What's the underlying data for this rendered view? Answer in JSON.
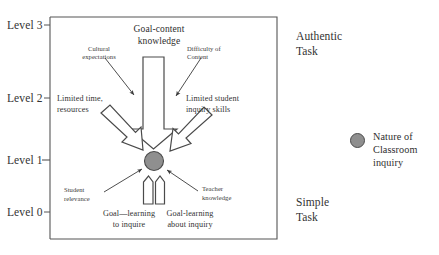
{
  "figure": {
    "type": "conceptual-diagram",
    "background": "#ffffff",
    "outline_color": "#555555"
  },
  "axis": {
    "levels": [
      {
        "label": "Level 3"
      },
      {
        "label": "Level 2"
      },
      {
        "label": "Level 1"
      },
      {
        "label": "Level 0"
      }
    ]
  },
  "side_labels": {
    "top": "Authentic\nTask",
    "top_line1": "Authentic",
    "top_line2": "Task",
    "bottom": "Simple\nTask",
    "bottom_line1": "Simple",
    "bottom_line2": "Task"
  },
  "nodes": {
    "goal_content_knowledge": "Goal-content\nknowledge",
    "goal_content_knowledge_line1": "Goal-content",
    "goal_content_knowledge_line2": "knowledge",
    "cultural_expectations": "Cultural\nexpectations",
    "cultural_expectations_line1": "Cultural",
    "cultural_expectations_line2": "expectations",
    "difficulty_of_content": "Difficulty of\nContent",
    "difficulty_of_content_line1": "Difficulty of",
    "difficulty_of_content_line2": "Content",
    "limited_time_resources": "Limited time,\nresources",
    "limited_time_resources_line1": "Limited time,",
    "limited_time_resources_line2": "resources",
    "limited_student_inquiry_skills": "Limited student\ninquiry skills",
    "limited_student_inquiry_skills_line1": "Limited student",
    "limited_student_inquiry_skills_line2": "inquiry skills",
    "student_relevance": "Student\nrelevance",
    "student_relevance_line1": "Student",
    "student_relevance_line2": "relevance",
    "teacher_knowledge": "Teacher\nknowledge",
    "teacher_knowledge_line1": "Teacher",
    "teacher_knowledge_line2": "knowledge",
    "goal_learning_to_inquire": "Goal—learning\nto inquire",
    "goal_learning_to_inquire_line1": "Goal—learning",
    "goal_learning_to_inquire_line2": "to inquire",
    "goal_learning_about_inquiry": "Goal-learning\nabout inquiry",
    "goal_learning_about_inquiry_line1": "Goal-learning",
    "goal_learning_about_inquiry_line2": "about inquiry"
  },
  "legend": {
    "marker_color": "#8f8f8f",
    "marker_border": "#4a4a4a",
    "text": "Nature of\nClassroom\ninquiry",
    "line1": "Nature of",
    "line2": "Classroom",
    "line3": "inquiry"
  },
  "central_node": {
    "name": "nature-of-classroom-inquiry",
    "fill": "#8f8f8f",
    "stroke": "#4a4a4a"
  }
}
